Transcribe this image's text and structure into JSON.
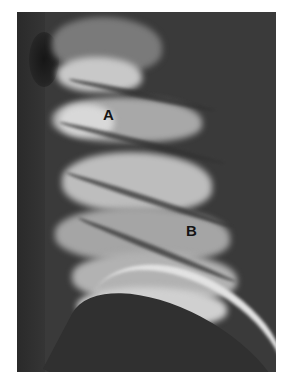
{
  "figure": {
    "type": "chest radiograph (lateral lung field)",
    "labels": [
      {
        "id": "A",
        "text": "A"
      },
      {
        "id": "B",
        "text": "B"
      }
    ],
    "colors": {
      "background": "#3a3a3a",
      "bone_highlight": "#e2e2e2",
      "label_text": "#141414",
      "page": "#ffffff"
    }
  }
}
